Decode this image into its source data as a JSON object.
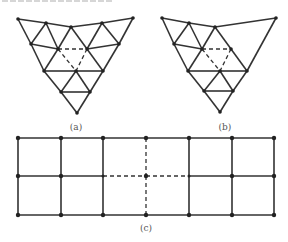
{
  "figure": {
    "colors": {
      "line": "#333333",
      "node": "#222222",
      "label": "#555555",
      "background": "#ffffff"
    },
    "panels": [
      {
        "id": "a",
        "label": "(a)",
        "description": "Triangle subdivided into triangular mesh; central triangle edges dashed",
        "nodes": [
          [
            18,
            19
          ],
          [
            46,
            23
          ],
          [
            71,
            27
          ],
          [
            102,
            23
          ],
          [
            133,
            18
          ],
          [
            31,
            44
          ],
          [
            58,
            49
          ],
          [
            87,
            49
          ],
          [
            119,
            44
          ],
          [
            44,
            71
          ],
          [
            76,
            71
          ],
          [
            103,
            71
          ],
          [
            61,
            92
          ],
          [
            90,
            92
          ],
          [
            77,
            113
          ]
        ],
        "solid_edges": [
          [
            0,
            1
          ],
          [
            1,
            2
          ],
          [
            2,
            3
          ],
          [
            3,
            4
          ],
          [
            0,
            5
          ],
          [
            5,
            9
          ],
          [
            9,
            12
          ],
          [
            12,
            14
          ],
          [
            4,
            8
          ],
          [
            8,
            11
          ],
          [
            11,
            13
          ],
          [
            13,
            14
          ],
          [
            1,
            5
          ],
          [
            1,
            6
          ],
          [
            5,
            6
          ],
          [
            6,
            9
          ],
          [
            2,
            6
          ],
          [
            2,
            7
          ],
          [
            3,
            7
          ],
          [
            3,
            8
          ],
          [
            7,
            8
          ],
          [
            7,
            11
          ],
          [
            9,
            10
          ],
          [
            10,
            11
          ],
          [
            10,
            12
          ],
          [
            10,
            13
          ],
          [
            12,
            13
          ]
        ],
        "dashed_edges": [
          [
            6,
            7
          ],
          [
            6,
            10
          ],
          [
            7,
            10
          ]
        ]
      },
      {
        "id": "b",
        "label": "(b)",
        "description": "Same mesh with right-upper subdivisions removed (coarse triangle)",
        "nodes": [
          [
            162,
            18
          ],
          [
            189,
            23
          ],
          [
            215,
            27
          ],
          [
            276,
            18
          ],
          [
            174,
            44
          ],
          [
            202,
            49
          ],
          [
            231,
            49
          ],
          [
            188,
            71
          ],
          [
            220,
            71
          ],
          [
            247,
            71
          ],
          [
            204,
            91
          ],
          [
            233,
            91
          ],
          [
            220,
            112
          ]
        ],
        "solid_edges": [
          [
            0,
            1
          ],
          [
            1,
            2
          ],
          [
            2,
            3
          ],
          [
            0,
            4
          ],
          [
            4,
            7
          ],
          [
            7,
            10
          ],
          [
            10,
            12
          ],
          [
            3,
            9
          ],
          [
            9,
            11
          ],
          [
            11,
            12
          ],
          [
            1,
            4
          ],
          [
            1,
            5
          ],
          [
            4,
            5
          ],
          [
            5,
            7
          ],
          [
            2,
            5
          ],
          [
            2,
            6
          ],
          [
            6,
            9
          ],
          [
            7,
            8
          ],
          [
            8,
            9
          ],
          [
            8,
            10
          ],
          [
            8,
            11
          ],
          [
            10,
            11
          ]
        ],
        "dashed_edges": [
          [
            5,
            6
          ],
          [
            5,
            8
          ],
          [
            6,
            8
          ]
        ]
      },
      {
        "id": "c",
        "label": "(c)",
        "description": "Rectangular grid 6x2 cells; central column edges and middle row around center dashed",
        "columns": [
          18,
          61,
          103,
          146,
          189,
          232,
          274
        ],
        "rows": [
          138,
          176,
          215
        ],
        "dashed": {
          "vertical_column_index": 3,
          "middle_row_span": [
            2,
            4
          ]
        }
      }
    ],
    "label_positions": {
      "a": [
        76,
        130
      ],
      "b": [
        225,
        130
      ],
      "c": [
        146,
        231
      ]
    }
  }
}
